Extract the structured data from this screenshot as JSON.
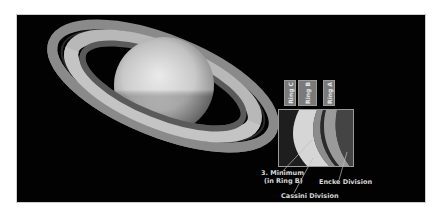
{
  "image": {
    "subject": "Saturn with ring system",
    "background_color": "#020202"
  },
  "ring_labels": [
    {
      "label": "Ring C"
    },
    {
      "label": "Ring B"
    },
    {
      "label": "Ring A"
    }
  ],
  "annotations": {
    "minimum_line1": "3. Minimum",
    "minimum_line2": "(in Ring B)",
    "cassini": "Cassini Division",
    "encke": "Encke Division"
  }
}
